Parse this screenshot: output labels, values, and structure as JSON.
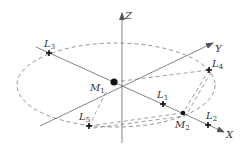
{
  "diagram": {
    "axes": {
      "x": {
        "label": "X"
      },
      "y": {
        "label": "Y"
      },
      "z": {
        "label": "Z"
      }
    },
    "bodies": [
      {
        "id": "M1",
        "label": "M",
        "sub": "1"
      },
      {
        "id": "M2",
        "label": "M",
        "sub": "2"
      }
    ],
    "points": [
      {
        "id": "L1",
        "label": "L",
        "sub": "1"
      },
      {
        "id": "L2",
        "label": "L",
        "sub": "2"
      },
      {
        "id": "L3",
        "label": "L",
        "sub": "3"
      },
      {
        "id": "L4",
        "label": "L",
        "sub": "4"
      },
      {
        "id": "L5",
        "label": "L",
        "sub": "5"
      }
    ],
    "colors": {
      "stroke": "#555555",
      "text": "#333333",
      "background": "#ffffff"
    }
  }
}
